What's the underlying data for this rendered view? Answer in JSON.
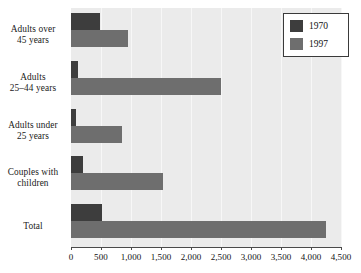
{
  "chart_data": {
    "type": "bar",
    "orientation": "horizontal",
    "title": "",
    "xlabel": "",
    "ylabel": "",
    "xlim": [
      0,
      4500
    ],
    "grid": true,
    "legend_position": "top-right",
    "categories": [
      "Adults over 45 years",
      "Adults 25–44 years",
      "Adults under 25 years",
      "Couples with children",
      "Total"
    ],
    "category_lines": [
      [
        "Adults over",
        "45 years"
      ],
      [
        "Adults",
        "25–44 years"
      ],
      [
        "Adults under",
        "25 years"
      ],
      [
        "Couples with",
        "children"
      ],
      [
        "Total"
      ]
    ],
    "series": [
      {
        "name": "1970",
        "color": "#3d3d3d",
        "values": [
          480,
          120,
          80,
          200,
          520
        ]
      },
      {
        "name": "1997",
        "color": "#6e6e6e",
        "values": [
          950,
          2500,
          850,
          1530,
          4250
        ]
      }
    ],
    "xticks": [
      0,
      500,
      1000,
      1500,
      2000,
      2500,
      3000,
      3500,
      4000,
      4500
    ],
    "xtick_labels": [
      "0",
      "500",
      "1,000",
      "1,500",
      "2,000",
      "2,500",
      "3,000",
      "3,500",
      "4,000",
      "4,500"
    ]
  },
  "legend": {
    "entries": [
      {
        "label": "1970"
      },
      {
        "label": "1997"
      }
    ]
  },
  "colors": {
    "series_1970": "#3d3d3d",
    "series_1997": "#6e6e6e",
    "plot_background": "#ebebeb",
    "axis": "#4a4a4a"
  }
}
